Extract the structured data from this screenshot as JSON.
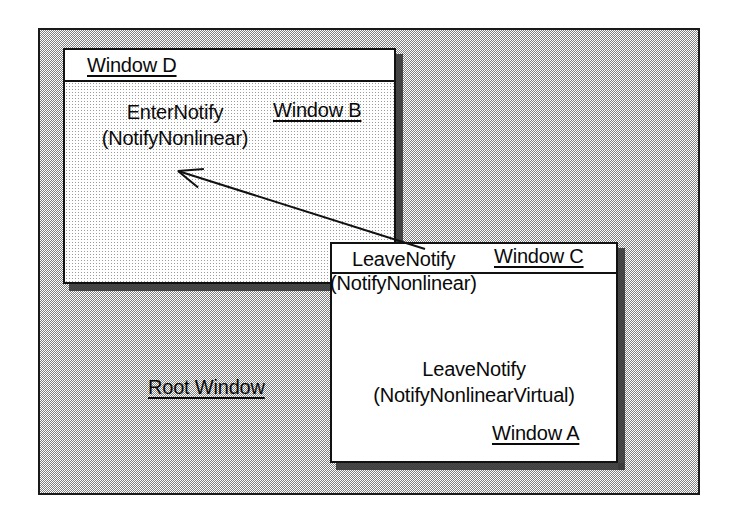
{
  "diagram": {
    "background_color": "#ffffff",
    "ink_color": "#0a0a0a"
  },
  "root_window": {
    "label": "Root Window",
    "fill": "dither-50-gray",
    "border_color": "#1a1a1a"
  },
  "windows": [
    {
      "id": "window-d",
      "titlebar_label": "Window D",
      "body_labels": [
        {
          "name": "event-label",
          "lines": [
            "EnterNotify",
            "(NotifyNonlinear)"
          ]
        },
        {
          "name": "window-b-label",
          "text": "Window B",
          "underlined": true
        }
      ],
      "fill": "dither-light-gray",
      "titlebar_fill": "#ffffff"
    },
    {
      "id": "window-c",
      "titlebar_label": "Window C",
      "titlebar_overlay_lines": [
        "LeaveNotify",
        "(NotifyNonlinear)"
      ],
      "body_labels": [
        {
          "name": "event-label",
          "lines": [
            "LeaveNotify",
            "(NotifyNonlinearVirtual)"
          ]
        },
        {
          "name": "window-a-label",
          "text": "Window A",
          "underlined": true
        }
      ],
      "fill": "#ffffff",
      "titlebar_fill": "#ffffff"
    }
  ],
  "labels": {
    "window_d_title": "Window D",
    "window_b": "Window B",
    "enter_notify": "EnterNotify",
    "enter_notify_detail": "(NotifyNonlinear)",
    "window_c_title": "Window C",
    "leave_notify_top": "LeaveNotify",
    "leave_notify_top_detail": "(NotifyNonlinear)",
    "leave_notify_body": "LeaveNotify",
    "leave_notify_body_detail": "(NotifyNonlinearVirtual)",
    "window_a": "Window A",
    "root_window": "Root Window"
  },
  "arrow": {
    "name": "pointer-motion-arrow",
    "from": {
      "x": 425,
      "y": 249
    },
    "to": {
      "x": 178,
      "y": 171
    },
    "color": "#111111",
    "stroke_width": 2,
    "head": "open-v"
  }
}
